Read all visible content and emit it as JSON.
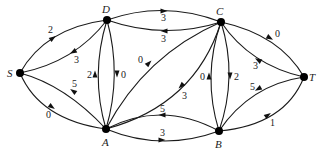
{
  "graph": {
    "nodes": [
      {
        "id": "S",
        "label": "S",
        "x": 20,
        "y": 73,
        "lx": 7,
        "ly": 77
      },
      {
        "id": "D",
        "label": "D",
        "x": 107,
        "y": 20,
        "lx": 102,
        "ly": 13
      },
      {
        "id": "C",
        "label": "C",
        "x": 221,
        "y": 22,
        "lx": 216,
        "ly": 15
      },
      {
        "id": "T",
        "label": "T",
        "x": 304,
        "y": 77,
        "lx": 309,
        "ly": 81
      },
      {
        "id": "A",
        "label": "A",
        "x": 106,
        "y": 129,
        "lx": 102,
        "ly": 146
      },
      {
        "id": "B",
        "label": "B",
        "x": 219,
        "y": 131,
        "lx": 215,
        "ly": 148
      }
    ],
    "edges": [
      {
        "from": "S",
        "to": "D",
        "weight": "2",
        "path": "M20,73 Q45,28 107,20",
        "ax": 53,
        "ay": 38,
        "angle": -35,
        "wx": 48,
        "wy": 33
      },
      {
        "from": "D",
        "to": "S",
        "weight": "3",
        "path": "M107,20 Q75,62 20,73",
        "ax": 73,
        "ay": 52,
        "angle": 150,
        "wx": 74,
        "wy": 63
      },
      {
        "from": "A",
        "to": "S",
        "weight": "5",
        "path": "M106,129 Q65,85 20,73",
        "ax": 73,
        "ay": 91,
        "angle": -145,
        "wx": 72,
        "wy": 87
      },
      {
        "from": "S",
        "to": "A",
        "weight": "0",
        "path": "M20,73 Q40,120 106,129",
        "ax": 52,
        "ay": 107,
        "angle": 35,
        "wx": 46,
        "wy": 118
      },
      {
        "from": "A",
        "to": "D",
        "weight": "2",
        "path": "M106,129 Q90,75 107,20",
        "ax": 95,
        "ay": 74,
        "angle": -90,
        "wx": 87,
        "wy": 78
      },
      {
        "from": "D",
        "to": "A",
        "weight": "0",
        "path": "M107,20 Q122,75 106,129",
        "ax": 117,
        "ay": 74,
        "angle": 90,
        "wx": 121,
        "wy": 78
      },
      {
        "from": "D",
        "to": "C",
        "weight": "3",
        "path": "M107,20 Q164,0 221,22",
        "ax": 164,
        "ay": 11,
        "angle": 0,
        "wx": 161,
        "wy": 21
      },
      {
        "from": "C",
        "to": "D",
        "weight": "3",
        "path": "M221,22 Q164,40 107,20",
        "ax": 164,
        "ay": 31,
        "angle": 180,
        "wx": 161,
        "wy": 42
      },
      {
        "from": "A",
        "to": "C",
        "weight": "0",
        "path": "M106,129 Q145,55 221,22",
        "ax": 149,
        "ay": 63,
        "angle": -45,
        "wx": 138,
        "wy": 63
      },
      {
        "from": "C",
        "to": "A",
        "weight": "3",
        "path": "M221,22 Q195,105 106,129",
        "ax": 181,
        "ay": 86,
        "angle": 135,
        "wx": 182,
        "wy": 99
      },
      {
        "from": "B",
        "to": "C",
        "weight": "0",
        "path": "M219,131 Q202,76 221,22",
        "ax": 209,
        "ay": 76,
        "angle": -90,
        "wx": 200,
        "wy": 80
      },
      {
        "from": "C",
        "to": "B",
        "weight": "2",
        "path": "M221,22 Q238,76 219,131",
        "ax": 230,
        "ay": 76,
        "angle": 90,
        "wx": 234,
        "wy": 80
      },
      {
        "from": "B",
        "to": "A",
        "weight": "5",
        "path": "M219,131 Q162,100 106,129",
        "ax": 162,
        "ay": 115,
        "angle": 180,
        "wx": 160,
        "wy": 112
      },
      {
        "from": "A",
        "to": "B",
        "weight": "3",
        "path": "M106,129 Q162,152 219,131",
        "ax": 162,
        "ay": 140,
        "angle": 0,
        "wx": 160,
        "wy": 136
      },
      {
        "from": "C",
        "to": "T",
        "weight": "0",
        "path": "M221,22 Q280,35 304,77",
        "ax": 270,
        "ay": 38,
        "angle": 30,
        "wx": 275,
        "wy": 37
      },
      {
        "from": "T",
        "to": "C",
        "weight": "3",
        "path": "M304,77 Q250,65 221,22",
        "ax": 258,
        "ay": 60,
        "angle": -150,
        "wx": 253,
        "wy": 69
      },
      {
        "from": "T",
        "to": "B",
        "weight": "5",
        "path": "M304,77 Q250,85 219,131",
        "ax": 258,
        "ay": 89,
        "angle": 150,
        "wx": 250,
        "wy": 90
      },
      {
        "from": "B",
        "to": "T",
        "weight": "1",
        "path": "M219,131 Q285,125 304,77",
        "ax": 268,
        "ay": 115,
        "angle": -35,
        "wx": 270,
        "wy": 126
      }
    ]
  }
}
